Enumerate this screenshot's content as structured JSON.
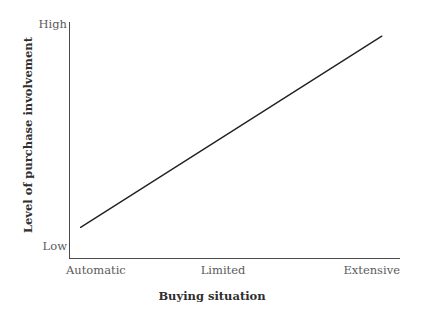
{
  "chart_data": {
    "type": "line",
    "title": "",
    "subtitle": "",
    "xlabel": "Buying situation",
    "ylabel": "Level of purchase involvement",
    "categories": [
      "Automatic",
      "Limited",
      "Extensive"
    ],
    "x": [
      0,
      1,
      2
    ],
    "y_tick_labels": [
      "Low",
      "High"
    ],
    "ylim": [
      "Low",
      "High"
    ],
    "grid": false,
    "legend": false,
    "legend_position": "none",
    "series": [
      {
        "name": "Level of purchase involvement",
        "x": [
          0.07,
          1,
          1.89
        ],
        "values": [
          0.13,
          0.53,
          0.94
        ],
        "description": "Straight increasing line from just above Low at Automatic to just below High at Extensive",
        "color": "#222222"
      }
    ],
    "annotations": []
  },
  "axes": {
    "y": {
      "label": "Level of purchase involvement",
      "tick_high": "High",
      "tick_low": "Low",
      "line_color": "#4b4b4b"
    },
    "x": {
      "label": "Buying situation",
      "ticks": [
        {
          "label": "Automatic"
        },
        {
          "label": "Limited"
        },
        {
          "label": "Extensive"
        }
      ],
      "line_color": "#4b4b4b"
    }
  },
  "colors": {
    "background": "#ffffff",
    "axis": "#4b4b4b",
    "tick_text": "#5a5a5a",
    "title_text": "#2f2f2f",
    "data_line": "#222222"
  }
}
